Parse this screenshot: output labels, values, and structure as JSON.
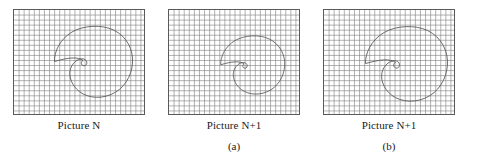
{
  "figure": {
    "type": "diagram",
    "background_color": "#ffffff",
    "grid_color": "#7d7d7d",
    "grid_border_color": "#5a5a5a",
    "shape_stroke_color": "#555555",
    "text_color": "#1a1a1a"
  },
  "panels": [
    {
      "id": "panel-1",
      "caption": "Picture N",
      "subcaption": "",
      "grid": {
        "cols": 26,
        "rows": 21,
        "cell_px": 5.08
      },
      "shape": {
        "name": "comma-spiral-outline",
        "translate_x": 0,
        "translate_y": 0,
        "scale": 1.0
      }
    },
    {
      "id": "panel-2",
      "caption": "Picture N+1",
      "subcaption": "(a)",
      "grid": {
        "cols": 26,
        "rows": 21,
        "cell_px": 5.08
      },
      "shape": {
        "name": "comma-spiral-outline",
        "translate_x": 4,
        "translate_y": 2,
        "scale": 0.82
      }
    },
    {
      "id": "panel-3",
      "caption": "Picture N+1",
      "subcaption": "(b)",
      "grid": {
        "cols": 26,
        "rows": 21,
        "cell_px": 5.08
      },
      "shape": {
        "name": "comma-spiral-outline",
        "translate_x": 8,
        "translate_y": 6,
        "scale": 1.05
      }
    }
  ],
  "labels": {
    "picture_n": "Picture N",
    "picture_n_plus_1_a": "Picture N+1",
    "picture_n_plus_1_b": "Picture N+1",
    "sub_a": "(a)",
    "sub_b": "(b)"
  }
}
